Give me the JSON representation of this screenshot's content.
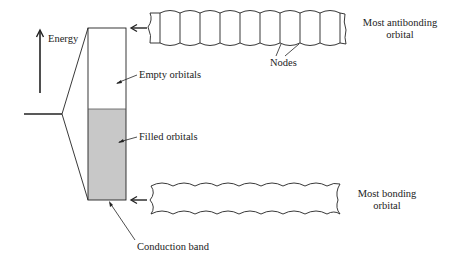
{
  "diagram": {
    "type": "energy-band-diagram",
    "axis": {
      "label": "Energy",
      "direction": "up"
    },
    "band": {
      "regions": [
        {
          "name": "empty",
          "label": "Empty orbitals",
          "fill": "#ffffff"
        },
        {
          "name": "filled",
          "label": "Filled orbitals",
          "fill": "#c8c8c8"
        }
      ],
      "bottom_label": "Conduction band"
    },
    "orbitals": [
      {
        "name": "antibonding",
        "label_line1": "Most antibonding",
        "label_line2": "orbital",
        "node_label": "Nodes"
      },
      {
        "name": "bonding",
        "label_line1": "Most bonding",
        "label_line2": "orbital"
      }
    ],
    "colors": {
      "stroke": "#222222",
      "filled": "#c8c8c8"
    }
  }
}
